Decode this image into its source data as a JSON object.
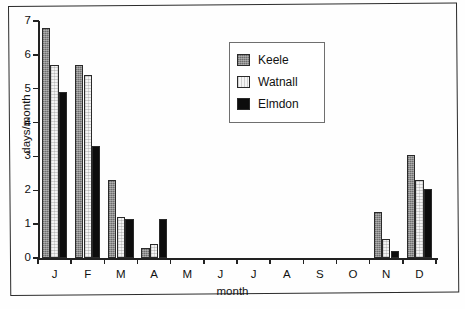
{
  "chart_data": {
    "type": "bar",
    "title": "",
    "xlabel": "month",
    "ylabel": "days/month",
    "ylim": [
      0,
      7
    ],
    "yticks": [
      "0",
      "1",
      "2",
      "3",
      "4",
      "5",
      "6",
      "7"
    ],
    "grid": false,
    "legend_position": "inside-upper-center-right",
    "categories": [
      "J",
      "F",
      "M",
      "A",
      "M",
      "J",
      "J",
      "A",
      "S",
      "O",
      "N",
      "D"
    ],
    "series": [
      {
        "name": "Keele",
        "color": "#8c8c8c",
        "values": [
          6.8,
          5.7,
          2.3,
          0.3,
          0,
          0,
          0,
          0,
          0,
          0,
          1.35,
          3.05
        ]
      },
      {
        "name": "Watnall",
        "color": "#f3f3f3",
        "values": [
          5.7,
          5.4,
          1.2,
          0.4,
          0,
          0,
          0,
          0,
          0,
          0,
          0.55,
          2.3
        ]
      },
      {
        "name": "Elmdon",
        "color": "#0d0d0d",
        "values": [
          4.9,
          3.3,
          1.15,
          1.15,
          0,
          0,
          0,
          0,
          0,
          0,
          0.2,
          2.05
        ]
      }
    ]
  }
}
